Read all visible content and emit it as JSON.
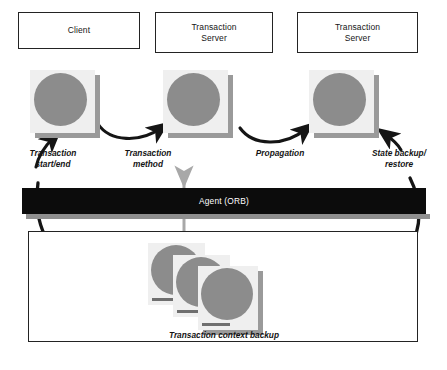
{
  "figure": {
    "caption": ""
  },
  "colors": {
    "box_border": "#232323",
    "page_fill": "#efefef",
    "disc_fill": "#8c8c8c",
    "shadow_fill": "#9a9a9a",
    "bar_fill": "#0c0c0c",
    "bar_text": "#ffffff",
    "arrow_black": "#151515",
    "arrow_gray": "#a8a8a8",
    "background": "#ffffff"
  },
  "components": [
    {
      "id": "client",
      "label_lines": [
        "Client"
      ]
    },
    {
      "id": "transaction-server-1",
      "label_lines": [
        "Transaction",
        "Server"
      ]
    },
    {
      "id": "transaction-server-2",
      "label_lines": [
        "Transaction",
        "Server"
      ]
    }
  ],
  "annotations": [
    {
      "id": "transaction-start-end",
      "lines": [
        "Transaction",
        "start/end"
      ]
    },
    {
      "id": "transaction-method",
      "lines": [
        "Transaction",
        "method"
      ]
    },
    {
      "id": "propagation",
      "lines": [
        "Propagation"
      ]
    },
    {
      "id": "state-backup-restore",
      "lines": [
        "State backup/",
        "restore"
      ]
    }
  ],
  "bus": {
    "id": "agent-orb",
    "label": "Agent (ORB)"
  },
  "backup_area": {
    "id": "transaction-context-backup",
    "label": "Transaction context backup",
    "document_count": 3
  },
  "icons": {
    "context_object": "context-object-icon",
    "curved_arrow": "curved-arrow-icon",
    "vertical_arrow": "vertical-double-arrow-icon"
  }
}
